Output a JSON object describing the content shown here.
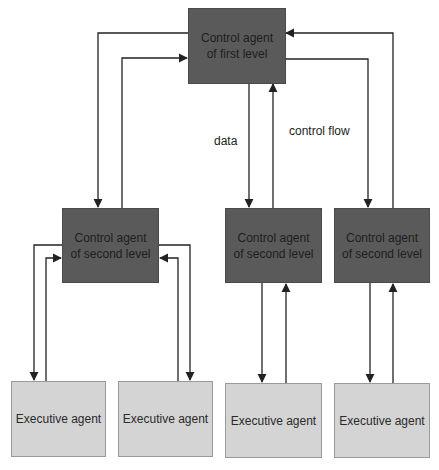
{
  "diagram": {
    "top": {
      "label": "Control agent of first level"
    },
    "second_level": [
      {
        "label": "Control agent of second level"
      },
      {
        "label": "Control agent of second level"
      },
      {
        "label": "Control agent of second level"
      }
    ],
    "executive": [
      {
        "label": "Executive agent"
      },
      {
        "label": "Executive agent"
      },
      {
        "label": "Executive agent"
      },
      {
        "label": "Executive agent"
      }
    ],
    "annotations": {
      "data": "data",
      "control_flow": "control flow"
    },
    "colors": {
      "control_box": "#5a5a5a",
      "executive_box": "#d4d4d4",
      "line": "#222222"
    }
  }
}
